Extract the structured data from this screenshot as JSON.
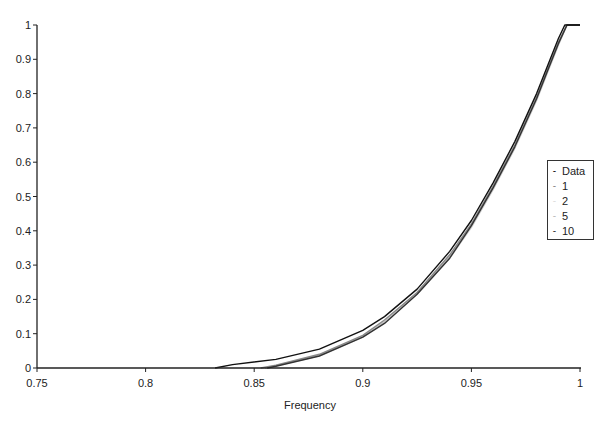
{
  "chart_data": {
    "type": "line",
    "title": "",
    "xlabel": "Frequency",
    "ylabel": "",
    "xlim": [
      0.75,
      1.0
    ],
    "ylim": [
      0,
      1
    ],
    "x_ticks": [
      "0.75",
      "0.8",
      "0.85",
      "0.9",
      "0.95",
      "1"
    ],
    "y_ticks": [
      "0",
      "0.1",
      "0.2",
      "0.3",
      "0.4",
      "0.5",
      "0.6",
      "0.7",
      "0.8",
      "0.9",
      "1"
    ],
    "grid": false,
    "legend_position": "right",
    "legend": [
      "Data",
      "1",
      "2",
      "5",
      "10"
    ],
    "series": [
      {
        "name": "Data",
        "color": "#111111",
        "x": [
          0.832,
          0.84,
          0.86,
          0.88,
          0.9,
          0.91,
          0.925,
          0.94,
          0.95,
          0.96,
          0.97,
          0.975,
          0.98,
          0.985,
          0.99,
          0.993,
          1.0
        ],
        "y": [
          0.0,
          0.01,
          0.025,
          0.055,
          0.11,
          0.15,
          0.23,
          0.34,
          0.43,
          0.54,
          0.66,
          0.73,
          0.8,
          0.88,
          0.96,
          1.0,
          1.0
        ]
      },
      {
        "name": "1",
        "color": "#888888",
        "x": [
          0.853,
          0.86,
          0.88,
          0.9,
          0.91,
          0.925,
          0.94,
          0.95,
          0.96,
          0.97,
          0.975,
          0.98,
          0.985,
          0.99,
          0.994,
          1.0
        ],
        "y": [
          0.0,
          0.008,
          0.04,
          0.095,
          0.14,
          0.22,
          0.33,
          0.42,
          0.53,
          0.65,
          0.72,
          0.79,
          0.87,
          0.95,
          1.0,
          1.0
        ]
      },
      {
        "name": "2",
        "color": "#bbbbbb",
        "x": [
          0.855,
          0.86,
          0.88,
          0.9,
          0.91,
          0.925,
          0.94,
          0.95,
          0.96,
          0.97,
          0.975,
          0.98,
          0.985,
          0.99,
          0.994,
          1.0
        ],
        "y": [
          0.0,
          0.007,
          0.038,
          0.092,
          0.135,
          0.22,
          0.325,
          0.415,
          0.525,
          0.645,
          0.715,
          0.785,
          0.865,
          0.945,
          1.0,
          1.0
        ]
      },
      {
        "name": "5",
        "color": "#cccccc",
        "x": [
          0.855,
          0.86,
          0.88,
          0.9,
          0.91,
          0.925,
          0.94,
          0.95,
          0.96,
          0.97,
          0.975,
          0.98,
          0.985,
          0.99,
          0.994,
          1.0
        ],
        "y": [
          0.0,
          0.006,
          0.036,
          0.09,
          0.133,
          0.215,
          0.32,
          0.41,
          0.52,
          0.64,
          0.71,
          0.78,
          0.86,
          0.94,
          1.0,
          1.0
        ]
      },
      {
        "name": "10",
        "color": "#333333",
        "x": [
          0.856,
          0.86,
          0.88,
          0.9,
          0.91,
          0.925,
          0.94,
          0.95,
          0.96,
          0.97,
          0.975,
          0.98,
          0.985,
          0.99,
          0.994,
          1.0
        ],
        "y": [
          0.0,
          0.005,
          0.035,
          0.09,
          0.13,
          0.215,
          0.32,
          0.415,
          0.525,
          0.645,
          0.715,
          0.785,
          0.865,
          0.945,
          1.0,
          1.0
        ]
      }
    ]
  },
  "legend_items": [
    {
      "label": "Data",
      "mark": "-"
    },
    {
      "label": "1",
      "mark": "-"
    },
    {
      "label": "2",
      "mark": "-"
    },
    {
      "label": "5",
      "mark": "-"
    },
    {
      "label": "10",
      "mark": "-"
    }
  ]
}
